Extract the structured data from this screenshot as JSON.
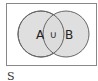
{
  "diagram": {
    "type": "venn",
    "universe_label": "S",
    "sets": [
      {
        "name": "A",
        "label": "A"
      },
      {
        "name": "B",
        "label": "B"
      }
    ],
    "intersection_label": "∪",
    "colors": {
      "fill": "#dcdcdc",
      "stroke": "#666666",
      "frame": "#888888"
    }
  }
}
